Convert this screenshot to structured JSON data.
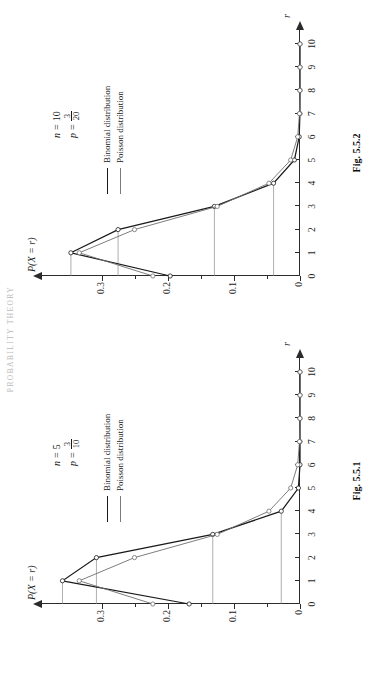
{
  "page": {
    "running_head": "PROBABILITY THEORY"
  },
  "legend": {
    "binomial_label": "Binomial distribution",
    "poisson_label": "Poisson distribution"
  },
  "axis": {
    "x_label": "r",
    "y_label": "P(X = r)",
    "x_ticks": [
      "0",
      "1",
      "2",
      "3",
      "4",
      "5",
      "6",
      "7",
      "8",
      "9",
      "10"
    ],
    "y_ticks": [
      "0",
      "0.1",
      "0.2",
      "0.3"
    ]
  },
  "figures": [
    {
      "id": "fig-5-5-1",
      "caption": "Fig. 5.5.1",
      "params": {
        "n_symbol": "n",
        "n_value": "5",
        "p_symbol": "p",
        "p_numerator": "3",
        "p_denominator": "10"
      }
    },
    {
      "id": "fig-5-5-2",
      "caption": "Fig. 5.5.2",
      "params": {
        "n_symbol": "n",
        "n_value": "10",
        "p_symbol": "p",
        "p_numerator": "3",
        "p_denominator": "20"
      }
    }
  ],
  "chart_data": [
    {
      "type": "line",
      "title": "Fig. 5.5.1",
      "xlabel": "r",
      "ylabel": "P(X = r)",
      "xlim": [
        0,
        10
      ],
      "ylim": [
        0,
        0.37
      ],
      "grid": false,
      "legend_position": "upper-right",
      "annotations": [
        "n = 5",
        "p = 3/10"
      ],
      "x": [
        0,
        1,
        2,
        3,
        4,
        5,
        6,
        7,
        8,
        9,
        10
      ],
      "series": [
        {
          "name": "Binomial distribution",
          "values": [
            0.1681,
            0.3602,
            0.3087,
            0.1323,
            0.0284,
            0.0024,
            0,
            0,
            0,
            0,
            0
          ]
        },
        {
          "name": "Poisson distribution",
          "values": [
            0.2231,
            0.3347,
            0.251,
            0.1255,
            0.0471,
            0.0141,
            0.0035,
            0.0008,
            0.0002,
            0,
            0
          ]
        }
      ]
    },
    {
      "type": "line",
      "title": "Fig. 5.5.2",
      "xlabel": "r",
      "ylabel": "P(X = r)",
      "xlim": [
        0,
        10
      ],
      "ylim": [
        0,
        0.37
      ],
      "grid": false,
      "legend_position": "upper-right",
      "annotations": [
        "n = 10",
        "p = 3/20"
      ],
      "x": [
        0,
        1,
        2,
        3,
        4,
        5,
        6,
        7,
        8,
        9,
        10
      ],
      "series": [
        {
          "name": "Binomial distribution",
          "values": [
            0.1969,
            0.3474,
            0.2759,
            0.1298,
            0.0401,
            0.0085,
            0.0012,
            0.0001,
            0,
            0,
            0
          ]
        },
        {
          "name": "Poisson distribution",
          "values": [
            0.2231,
            0.3347,
            0.251,
            0.1255,
            0.0471,
            0.0141,
            0.0035,
            0.0008,
            0.0002,
            0,
            0
          ]
        }
      ]
    }
  ]
}
